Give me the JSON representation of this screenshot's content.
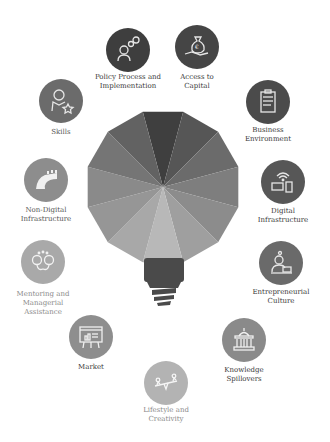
{
  "diagram": {
    "title": "",
    "center": {
      "shape": "light-bulb",
      "segment_colors": [
        "#3f3f3f",
        "#565656",
        "#6b6b6b",
        "#7e7e7e",
        "#8c8c8c",
        "#9f9f9f",
        "#b8b8b8",
        "#a8a8a8",
        "#969696",
        "#8a8a8a",
        "#757575",
        "#626262"
      ],
      "base_color": "#4a4a4a"
    },
    "nodes": [
      {
        "id": "policy",
        "label": "Policy Process and\nImplementation",
        "icon": "gears-person-icon",
        "color": "#3e3e3e",
        "x": 128,
        "y": 50
      },
      {
        "id": "capital",
        "label": "Access to\nCapital",
        "icon": "money-bag-hand-icon",
        "color": "#454545",
        "x": 197,
        "y": 47
      },
      {
        "id": "business",
        "label": "Business\nEnvironment",
        "icon": "clipboard-icon",
        "color": "#4b4b4b",
        "x": 268,
        "y": 102
      },
      {
        "id": "digital",
        "label": "Digital\nInfrastructure",
        "icon": "wifi-devices-icon",
        "color": "#575757",
        "x": 283,
        "y": 182
      },
      {
        "id": "entrepreneurial",
        "label": "Entrepreneurial\nCulture",
        "icon": "person-laptop-icon",
        "color": "#6a6a6a",
        "x": 281,
        "y": 263
      },
      {
        "id": "knowledge",
        "label": "Knowledge\nSpillovers",
        "icon": "building-columns-icon",
        "color": "#8a8a8a",
        "x": 244,
        "y": 340
      },
      {
        "id": "lifestyle",
        "label": "Lifestyle and\nCreativity",
        "icon": "seesaw-icon",
        "color": "#b3b3b3",
        "x": 166,
        "y": 383
      },
      {
        "id": "market",
        "label": "Market",
        "icon": "presentation-board-icon",
        "color": "#8e8e8e",
        "x": 91,
        "y": 337
      },
      {
        "id": "mentoring",
        "label": "Mentoring and\nManagerial\nAssistance",
        "icon": "two-heads-icon",
        "color": "#a9a9a9",
        "x": 43,
        "y": 262
      },
      {
        "id": "nondigital",
        "label": "Non-Digital\nInfrastructure",
        "icon": "road-bridge-icon",
        "color": "#8d8d8d",
        "x": 46,
        "y": 180
      },
      {
        "id": "skills",
        "label": "Skills",
        "icon": "person-star-icon",
        "color": "#6b6b6b",
        "x": 61,
        "y": 101
      }
    ]
  }
}
